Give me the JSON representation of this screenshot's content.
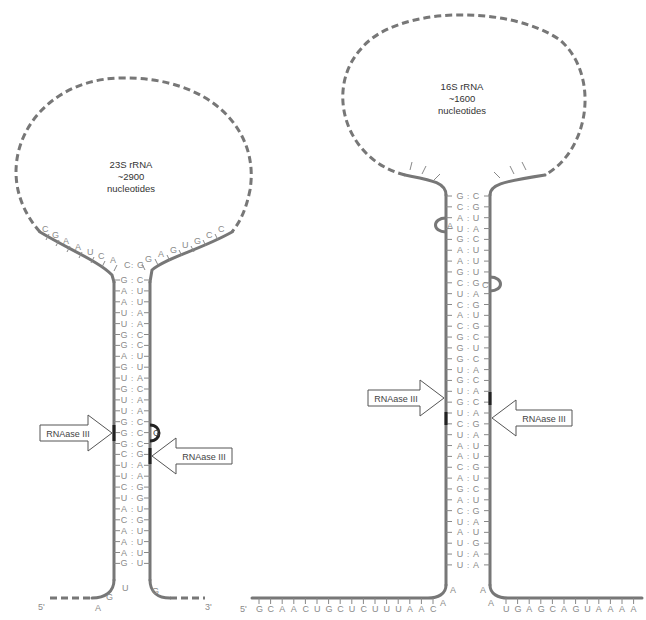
{
  "left_structure": {
    "loop_label": [
      "23S rRNA",
      "~2900",
      "nucleotides"
    ],
    "loop_5p_unpaired": [
      "C",
      "G",
      "A",
      "A",
      "U",
      "C",
      "A",
      "G"
    ],
    "loop_3p_unpaired": [
      "G",
      "A",
      "G",
      "U",
      "G",
      "C",
      "C"
    ],
    "stem_pairs": [
      [
        "C",
        ":",
        "G"
      ],
      [
        "G",
        ":",
        "C"
      ],
      [
        "A",
        ":",
        "U"
      ],
      [
        "A",
        ":",
        "U"
      ],
      [
        "U",
        ":",
        "A"
      ],
      [
        "U",
        ":",
        "A"
      ],
      [
        "G",
        ":",
        "C"
      ],
      [
        "G",
        ":",
        "C"
      ],
      [
        "A",
        ":",
        "U"
      ],
      [
        "G",
        "·",
        "U"
      ],
      [
        "U",
        ":",
        "A"
      ],
      [
        "G",
        ":",
        "C"
      ],
      [
        "U",
        ":",
        "A"
      ],
      [
        "U",
        ":",
        "A"
      ],
      [
        "G",
        ":",
        "C"
      ],
      [
        "G",
        ":",
        "C"
      ],
      [
        "G",
        ":",
        "C"
      ],
      [
        "C",
        ":",
        "G"
      ],
      [
        "U",
        ":",
        "A"
      ],
      [
        "U",
        ":",
        "A"
      ],
      [
        "C",
        ":",
        "G"
      ],
      [
        "U",
        "·",
        "G"
      ],
      [
        "A",
        ":",
        "U"
      ],
      [
        "C",
        ":",
        "G"
      ],
      [
        "A",
        ":",
        "U"
      ],
      [
        "A",
        ":",
        "U"
      ],
      [
        "A",
        ":",
        "U"
      ],
      [
        "G",
        "·",
        "U"
      ]
    ],
    "bulge": "G",
    "bottom_5p": [
      "A",
      "G",
      "U"
    ],
    "bottom_3p": [
      "G"
    ],
    "end_5p": "5'",
    "end_3p": "3'",
    "cleavage_label_left": "RNAase III",
    "cleavage_label_right": "RNAase III"
  },
  "right_structure": {
    "loop_label": [
      "16S rRNA",
      "~1600",
      "nucleotides"
    ],
    "stem_pairs": [
      [
        "G",
        ":",
        "C"
      ],
      [
        "C",
        ":",
        "G"
      ],
      [
        "A",
        ":",
        "U"
      ],
      [
        "U",
        ":",
        "A"
      ],
      [
        "G",
        ":",
        "C"
      ],
      [
        "A",
        ":",
        "U"
      ],
      [
        "A",
        ":",
        "U"
      ],
      [
        "G",
        ":",
        "U"
      ],
      [
        "C",
        ":",
        "G"
      ],
      [
        "U",
        ":",
        "A"
      ],
      [
        "C",
        ":",
        "G"
      ],
      [
        "A",
        ":",
        "U"
      ],
      [
        "C",
        ":",
        "G"
      ],
      [
        "G",
        ":",
        "C"
      ],
      [
        "G",
        "·",
        "U"
      ],
      [
        "G",
        "·",
        "C"
      ],
      [
        "U",
        ":",
        "A"
      ],
      [
        "G",
        ":",
        "C"
      ],
      [
        "U",
        ":",
        "A"
      ],
      [
        "G",
        ":",
        "C"
      ],
      [
        "U",
        ":",
        "A"
      ],
      [
        "C",
        ":",
        "G"
      ],
      [
        "U",
        ":",
        "A"
      ],
      [
        "A",
        ":",
        "U"
      ],
      [
        "A",
        ":",
        "U"
      ],
      [
        "C",
        ":",
        "G"
      ],
      [
        "A",
        ":",
        "U"
      ],
      [
        "G",
        ":",
        "C"
      ],
      [
        "A",
        ":",
        "U"
      ],
      [
        "C",
        ":",
        "G"
      ],
      [
        "U",
        ":",
        "A"
      ],
      [
        "A",
        "·",
        "U"
      ],
      [
        "U",
        "·",
        "G"
      ],
      [
        "U",
        ":",
        "A"
      ],
      [
        "U",
        ":",
        "A"
      ]
    ],
    "bulge_left": "A",
    "bulge_right": "C",
    "tail_5p": [
      "G",
      "C",
      "A",
      "A",
      "C",
      "U",
      "G",
      "C",
      "U",
      "C",
      "U",
      "U",
      "U",
      "A",
      "A",
      "C"
    ],
    "junction_5p": [
      "A",
      "A"
    ],
    "junction_3p": [
      "A",
      "A"
    ],
    "tail_3p": [
      "U",
      "G",
      "A",
      "G",
      "C",
      "A",
      "G",
      "U",
      "A",
      "A",
      "A",
      "A"
    ],
    "end_5p": "5'",
    "cleavage_label_left": "RNAase III",
    "cleavage_label_right": "RNAase III"
  },
  "colors": {
    "backbone": "#777777",
    "nucleotide_text": "#8a8a8a",
    "cleavage_mark": "#222222",
    "arrow_fill": "#ffffff",
    "arrow_stroke": "#555555"
  }
}
